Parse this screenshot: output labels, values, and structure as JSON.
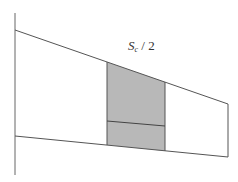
{
  "diagram": {
    "label": {
      "variable": "S",
      "subscript": "c",
      "suffix": " / 2"
    },
    "colors": {
      "line": "#555555",
      "shade": "#b8b8b8",
      "background": "#ffffff"
    }
  }
}
